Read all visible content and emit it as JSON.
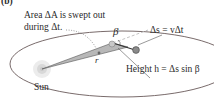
{
  "panel_label": "(b)",
  "labels": {
    "area_line1": "Area ΔA is swept out",
    "area_line2": "during Δt.",
    "beta": "β",
    "r": "r",
    "ds": "Δs = vΔt",
    "height": "Height h = Δs sin β",
    "sun": "Sun"
  },
  "colors": {
    "orbit": "#6a5a5a",
    "wedge_fill": "#b8b8b8",
    "wedge_stroke": "#555555",
    "planet": "#8a8a8a",
    "sun_glow": "#e0e0e0",
    "text": "#2a2a2a",
    "dashed": "#bbbbbb"
  }
}
